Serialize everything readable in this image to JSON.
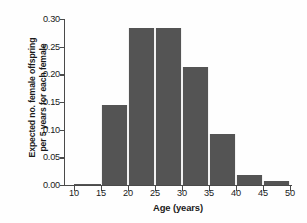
{
  "chart_data": {
    "type": "bar",
    "title": "",
    "xlabel": "Age (years)",
    "ylabel_line1": "Expected no. female offspring",
    "ylabel_line2": "per 5 years for each female",
    "ylabel": "Expected no. female offspring per 5 years for each female",
    "grid": false,
    "legend": "none",
    "bar_color": "#545454",
    "axis_color": "#4a4a4a",
    "background": "#fefefe",
    "xlim": [
      10,
      50
    ],
    "ylim": [
      0.0,
      0.3
    ],
    "bin_width": 5,
    "xticks": [
      10,
      15,
      20,
      25,
      30,
      35,
      40,
      45,
      50
    ],
    "xtick_labels": [
      "10",
      "15",
      "20",
      "25",
      "30",
      "35",
      "40",
      "45",
      "50"
    ],
    "yticks": [
      0.0,
      0.05,
      0.1,
      0.15,
      0.2,
      0.25,
      0.3
    ],
    "ytick_labels": [
      "0.00",
      "0.05",
      "0.10",
      "0.15",
      "0.20",
      "0.25",
      "0.30"
    ],
    "categories": [
      "10-15",
      "15-20",
      "20-25",
      "25-30",
      "30-35",
      "35-40",
      "40-45",
      "45-50"
    ],
    "bin_starts": [
      10,
      15,
      20,
      25,
      30,
      35,
      40,
      45
    ],
    "values": [
      0.002,
      0.144,
      0.284,
      0.284,
      0.214,
      0.092,
      0.019,
      0.008
    ]
  }
}
